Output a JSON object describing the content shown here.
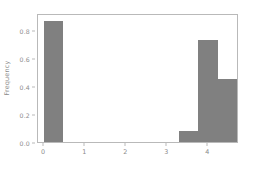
{
  "chart_data": {
    "type": "bar",
    "title": "",
    "subtitle": "",
    "xlabel": "",
    "ylabel": "Frequency",
    "xlim": [
      -0.15,
      4.75
    ],
    "ylim": [
      0.0,
      0.92
    ],
    "grid": false,
    "legend": null,
    "bar_color": "#808080",
    "axes_color": "#b9b9b9",
    "tick_color": "#8c8c8c",
    "background": "#ffffff",
    "xticks": [
      0,
      1,
      2,
      3,
      4
    ],
    "xtick_labels": [
      "0",
      "1",
      "2",
      "3",
      "4"
    ],
    "yticks": [
      0.0,
      0.2,
      0.4,
      0.6,
      0.8
    ],
    "ytick_labels": [
      "0.0",
      "0.2",
      "0.4",
      "0.6",
      "0.8"
    ],
    "bars": [
      {
        "label": "bin-0",
        "x_left": 0.0,
        "x_right": 0.47,
        "value": 0.86
      },
      {
        "label": "bin-7",
        "x_left": 3.29,
        "x_right": 3.76,
        "value": 0.08
      },
      {
        "label": "bin-8",
        "x_left": 3.76,
        "x_right": 4.23,
        "value": 0.73
      },
      {
        "label": "bin-9",
        "x_left": 4.23,
        "x_right": 4.7,
        "value": 0.45
      }
    ]
  }
}
